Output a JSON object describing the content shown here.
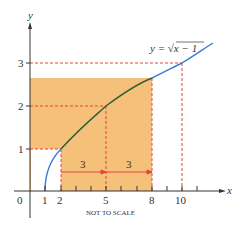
{
  "diagram": {
    "function_label": "y = √x − 1",
    "function_label_parts": {
      "lhs": "y = ",
      "radical": "√",
      "radicand": "x − 1"
    },
    "axes": {
      "x_label": "x",
      "y_label": "y"
    },
    "x_ticks": [
      {
        "value": 0,
        "label": "0"
      },
      {
        "value": 1,
        "label": "1"
      },
      {
        "value": 2,
        "label": "2"
      },
      {
        "value": 5,
        "label": "5"
      },
      {
        "value": 8,
        "label": "8"
      },
      {
        "value": 10,
        "label": "10"
      }
    ],
    "y_ticks": [
      {
        "value": 1,
        "label": "1"
      },
      {
        "value": 2,
        "label": "2"
      },
      {
        "value": 3,
        "label": "3"
      }
    ],
    "interval_labels": [
      {
        "from": 2,
        "to": 5,
        "label": "3"
      },
      {
        "from": 5,
        "to": 8,
        "label": "3"
      }
    ],
    "note": "NOT TO SCALE",
    "colors": {
      "shade": "#f5c07a",
      "curve_outside": "#3a7bd5",
      "curve_inside": "#2f5d3a",
      "dashed": "#e0443a",
      "axis": "#333333"
    }
  }
}
